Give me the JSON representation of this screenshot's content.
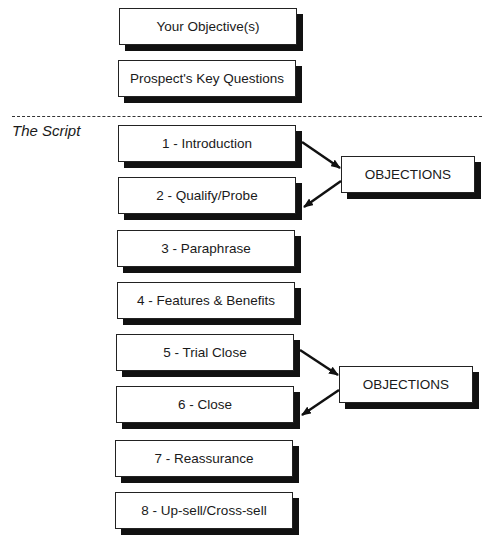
{
  "header_boxes": [
    {
      "label": "Your Objective(s)"
    },
    {
      "label": "Prospect's Key Questions"
    }
  ],
  "section_label": "The Script",
  "script_steps": [
    {
      "label": "1 - Introduction"
    },
    {
      "label": "2 - Qualify/Probe"
    },
    {
      "label": "3 - Paraphrase"
    },
    {
      "label": "4 - Features & Benefits"
    },
    {
      "label": "5 - Trial Close"
    },
    {
      "label": "6 - Close"
    },
    {
      "label": "7 - Reassurance"
    },
    {
      "label": "8 - Up-sell/Cross-sell"
    }
  ],
  "objection_boxes": [
    {
      "label": "OBJECTIONS",
      "from_step": "1 - Introduction",
      "to_step": "2 - Qualify/Probe"
    },
    {
      "label": "OBJECTIONS",
      "from_step": "5 - Trial Close",
      "to_step": "6 - Close"
    }
  ]
}
